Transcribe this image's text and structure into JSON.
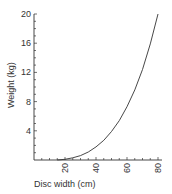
{
  "chart_data": {
    "type": "line",
    "title": "",
    "xlabel": "Disc width (cm)",
    "ylabel": "Weight (kg)",
    "xlim": [
      0,
      80
    ],
    "ylim": [
      0,
      20
    ],
    "x_ticks": [
      20,
      40,
      60,
      80
    ],
    "y_ticks": [
      4,
      8,
      12,
      16,
      20
    ],
    "x_minor_step": 5,
    "y_minor_step": 1,
    "grid": false,
    "legend": null,
    "series": [
      {
        "name": "Weight vs disc width",
        "color": "#333333",
        "x": [
          15,
          20,
          25,
          30,
          35,
          40,
          45,
          50,
          55,
          60,
          65,
          70,
          75,
          80
        ],
        "y": [
          0.0,
          0.1,
          0.3,
          0.6,
          1.1,
          1.8,
          2.7,
          3.9,
          5.4,
          7.3,
          9.6,
          12.4,
          15.9,
          20.0
        ]
      }
    ]
  }
}
